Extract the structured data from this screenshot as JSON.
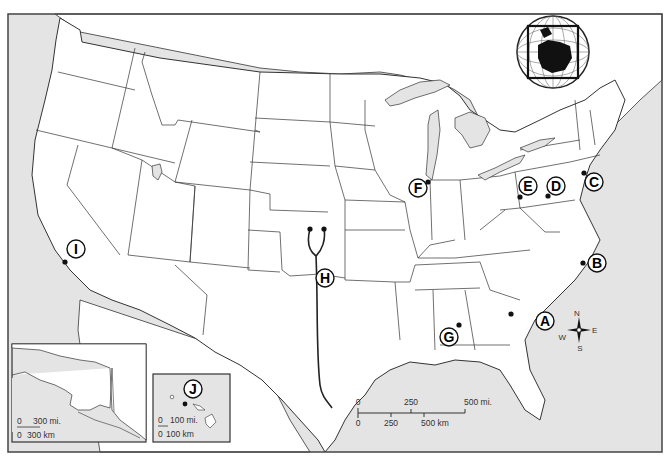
{
  "map": {
    "type": "outline-map",
    "region": "United States",
    "colors": {
      "water": "#e4e4e4",
      "land": "#ffffff",
      "border": "#333333",
      "frame": "#444444",
      "marker": "#111111"
    }
  },
  "markers": [
    {
      "id": "A",
      "label": "A",
      "dot": [
        511,
        314
      ],
      "circle": [
        545,
        321
      ]
    },
    {
      "id": "B",
      "label": "B",
      "dot": [
        583,
        263
      ],
      "circle": [
        597,
        263
      ]
    },
    {
      "id": "C",
      "label": "C",
      "dot": [
        584,
        173
      ],
      "circle": [
        594,
        182
      ]
    },
    {
      "id": "D",
      "label": "D",
      "dot": [
        548,
        196
      ],
      "circle": [
        556,
        186
      ]
    },
    {
      "id": "E",
      "label": "E",
      "dot": [
        520,
        197
      ],
      "circle": [
        528,
        186
      ]
    },
    {
      "id": "F",
      "label": "F",
      "dot": [
        428,
        182
      ],
      "circle": [
        418,
        188
      ]
    },
    {
      "id": "G",
      "label": "G",
      "dot": [
        459,
        325
      ],
      "circle": [
        449,
        337
      ]
    },
    {
      "id": "H",
      "label": "H",
      "dot": [
        310,
        229
      ],
      "circle": [
        325,
        278
      ]
    },
    {
      "id": "I",
      "label": "I",
      "dot": [
        65,
        262
      ],
      "circle": [
        76,
        251
      ]
    },
    {
      "id": "J",
      "label": "J",
      "dot": [
        185,
        404
      ],
      "circle": [
        193,
        389
      ]
    }
  ],
  "scale_bar": {
    "mi_labels": [
      "0",
      "250",
      "500 mi."
    ],
    "km_labels": [
      "0",
      "250",
      "500 km"
    ]
  },
  "alaska_inset": {
    "mi_labels": [
      "0",
      "300 mi."
    ],
    "km_labels": [
      "0",
      "300 km"
    ]
  },
  "hawaii_inset": {
    "marker_label": "J",
    "mi_labels": [
      "0",
      "100 mi."
    ],
    "km_labels": [
      "0",
      "100 km"
    ]
  },
  "compass": {
    "n": "N",
    "s": "S",
    "e": "E",
    "w": "W"
  },
  "globe_inset": {
    "description": "globe-locator-north-america"
  }
}
